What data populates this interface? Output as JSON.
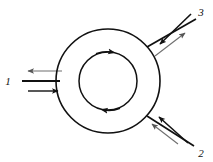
{
  "diagram": {
    "background_color": "#ffffff",
    "stroke_color": "#111111",
    "light_stroke_color": "#7a7a7a",
    "outer_circle": {
      "name": "outer-circle",
      "cx": 108,
      "cy": 81,
      "r": 52
    },
    "inner_circle": {
      "name": "inner-circle",
      "cx": 108,
      "cy": 81,
      "r": 29,
      "flow_direction": "clockwise",
      "arrowheads": [
        {
          "position": "top",
          "points": "right"
        },
        {
          "position": "bottom",
          "points": "left"
        }
      ]
    },
    "ports": [
      {
        "id": "port-1",
        "label": "1",
        "label_x": 8,
        "label_y": 81,
        "side": "left",
        "angle_deg": 180,
        "streams": [
          {
            "name": "outflow",
            "direction": "left",
            "weight": "light"
          },
          {
            "name": "inflow",
            "direction": "right",
            "weight": "heavy"
          }
        ]
      },
      {
        "id": "port-3",
        "label": "3",
        "label_x": 201,
        "label_y": 13,
        "side": "upper-right",
        "angle_deg": 45,
        "streams": [
          {
            "name": "inflow",
            "direction": "down-left",
            "weight": "heavy"
          },
          {
            "name": "outflow",
            "direction": "up-right",
            "weight": "light"
          }
        ]
      },
      {
        "id": "port-2",
        "label": "2",
        "label_x": 201,
        "label_y": 153,
        "side": "lower-right",
        "angle_deg": 315,
        "streams": [
          {
            "name": "inflow-upper",
            "direction": "up-left",
            "weight": "heavy"
          },
          {
            "name": "inflow-lower",
            "direction": "up-left",
            "weight": "light"
          }
        ]
      }
    ]
  }
}
